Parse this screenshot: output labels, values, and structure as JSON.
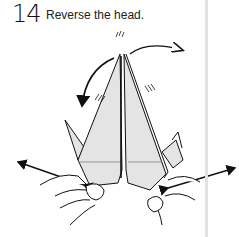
{
  "step": {
    "number": "14",
    "instruction": "Reverse the head."
  },
  "diagram": {
    "paper_color": "#e4e4e4",
    "line_color": "#111111",
    "elements": [
      "curved-arrow-head-reverse",
      "left-pull-arrow",
      "right-pull-arrow",
      "left-hand",
      "right-hand"
    ]
  }
}
